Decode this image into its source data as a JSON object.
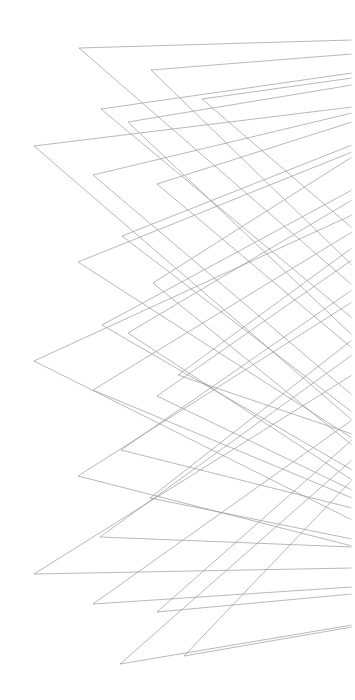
{
  "canvas": {
    "width": 355,
    "height": 700,
    "background": "#ffffff"
  },
  "style": {
    "stroke": "#9a9a9a",
    "stroke_width": 0.7
  },
  "chevrons": [
    {
      "apex": [
        79,
        48
      ],
      "upper": [
        352,
        40
      ],
      "lower": [
        352,
        285
      ]
    },
    {
      "apex": [
        151,
        70
      ],
      "upper": [
        352,
        54
      ],
      "lower": [
        352,
        265
      ]
    },
    {
      "apex": [
        101,
        109
      ],
      "upper": [
        352,
        73
      ],
      "lower": [
        352,
        318
      ]
    },
    {
      "apex": [
        202,
        99
      ],
      "upper": [
        352,
        78
      ],
      "lower": [
        352,
        228
      ]
    },
    {
      "apex": [
        128,
        122
      ],
      "upper": [
        352,
        85
      ],
      "lower": [
        352,
        335
      ]
    },
    {
      "apex": [
        34,
        146
      ],
      "upper": [
        352,
        107
      ],
      "lower": [
        352,
        420
      ]
    },
    {
      "apex": [
        93,
        175
      ],
      "upper": [
        352,
        113
      ],
      "lower": [
        352,
        395
      ]
    },
    {
      "apex": [
        157,
        184
      ],
      "upper": [
        352,
        122
      ],
      "lower": [
        352,
        348
      ]
    },
    {
      "apex": [
        122,
        236
      ],
      "upper": [
        352,
        145
      ],
      "lower": [
        352,
        412
      ]
    },
    {
      "apex": [
        78,
        262
      ],
      "upper": [
        352,
        152
      ],
      "lower": [
        352,
        438
      ]
    },
    {
      "apex": [
        153,
        283
      ],
      "upper": [
        352,
        157
      ],
      "lower": [
        352,
        445
      ]
    },
    {
      "apex": [
        102,
        325
      ],
      "upper": [
        352,
        190
      ],
      "lower": [
        352,
        470
      ]
    },
    {
      "apex": [
        128,
        333
      ],
      "upper": [
        352,
        200
      ],
      "lower": [
        352,
        480
      ]
    },
    {
      "apex": [
        34,
        361
      ],
      "upper": [
        352,
        215
      ],
      "lower": [
        352,
        520
      ]
    },
    {
      "apex": [
        93,
        390
      ],
      "upper": [
        352,
        232
      ],
      "lower": [
        352,
        498
      ]
    },
    {
      "apex": [
        178,
        375
      ],
      "upper": [
        352,
        248
      ],
      "lower": [
        352,
        434
      ]
    },
    {
      "apex": [
        157,
        396
      ],
      "upper": [
        352,
        260
      ],
      "lower": [
        352,
        490
      ]
    },
    {
      "apex": [
        121,
        450
      ],
      "upper": [
        352,
        290
      ],
      "lower": [
        352,
        508
      ]
    },
    {
      "apex": [
        78,
        476
      ],
      "upper": [
        352,
        302
      ],
      "lower": [
        352,
        546
      ]
    },
    {
      "apex": [
        150,
        498
      ],
      "upper": [
        352,
        340
      ],
      "lower": [
        352,
        539
      ]
    },
    {
      "apex": [
        100,
        537
      ],
      "upper": [
        352,
        355
      ],
      "lower": [
        352,
        547
      ]
    },
    {
      "apex": [
        34,
        574
      ],
      "upper": [
        352,
        375
      ],
      "lower": [
        352,
        568
      ]
    },
    {
      "apex": [
        93,
        604
      ],
      "upper": [
        352,
        420
      ],
      "lower": [
        352,
        587
      ]
    },
    {
      "apex": [
        157,
        612
      ],
      "upper": [
        352,
        440
      ],
      "lower": [
        352,
        594
      ]
    },
    {
      "apex": [
        120,
        664
      ],
      "upper": [
        352,
        460
      ],
      "lower": [
        352,
        625
      ]
    },
    {
      "apex": [
        184,
        656
      ],
      "upper": [
        352,
        480
      ],
      "lower": [
        352,
        627
      ]
    }
  ]
}
